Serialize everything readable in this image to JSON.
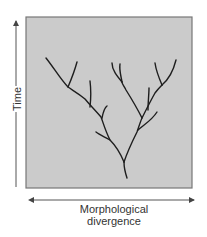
{
  "diagram": {
    "type": "phylogenetic-tree",
    "y_axis": {
      "label": "Time",
      "direction": "up"
    },
    "x_axis": {
      "label_line1": "Morphological",
      "label_line2": "divergence",
      "direction": "both"
    },
    "colors": {
      "panel_fill": "#cbcbcb",
      "panel_border": "#777777",
      "branch": "#1e1e1e",
      "axis": "#555555"
    },
    "branches": [
      {
        "name": "root",
        "d": "M127,178 C125,172 124,167 124,162"
      },
      {
        "name": "left-trunk",
        "d": "M124,162 C119,150 114,144 110,140 C105,130 103,122 101,117 C95,110 89,104 85,99 C78,93 72,90 68,87 C61,80 54,68 46,58"
      },
      {
        "name": "left-tip-upper",
        "d": "M68,87 C71,80 74,73 77,62"
      },
      {
        "name": "left-twig-2",
        "d": "M90,107 C91,98 91,89 90,81"
      },
      {
        "name": "left-twig-3",
        "d": "M102,118 C103,113 104,108 107,106"
      },
      {
        "name": "left-twig-low",
        "d": "M110,140 C105,137 100,135 96,132"
      },
      {
        "name": "right-trunk",
        "d": "M124,162 C128,150 133,140 137,132 C139,126 141,120 142,118 C147,108 151,100 155,93 C158,89 160,87 162,85"
      },
      {
        "name": "right-inner-stem",
        "d": "M142,118 C137,108 131,98 126,90 C124,86 122,84 122,82"
      },
      {
        "name": "right-inner-tip-a",
        "d": "M122,82 C117,76 112,70 112,63"
      },
      {
        "name": "right-inner-tip-b",
        "d": "M122,82 C121,76 119,70 120,64"
      },
      {
        "name": "right-outer-tip-a",
        "d": "M162,85 C159,78 156,70 155,63"
      },
      {
        "name": "right-outer-tip-b",
        "d": "M162,85 C168,80 173,72 176,60"
      },
      {
        "name": "right-mid-twig",
        "d": "M148,110 C148,102 149,94 149,88"
      },
      {
        "name": "right-low-twig",
        "d": "M138,130 C145,124 152,120 157,112"
      }
    ]
  }
}
